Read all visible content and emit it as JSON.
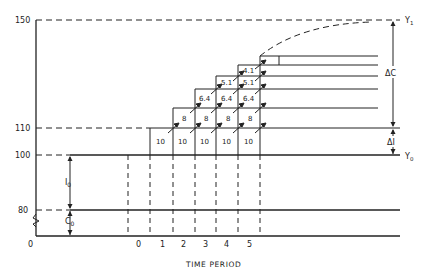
{
  "diagram": {
    "y_axis": {
      "ticks": [
        {
          "label": "150",
          "y": 20
        },
        {
          "label": "110",
          "y": 128
        },
        {
          "label": "100",
          "y": 155
        },
        {
          "label": "80",
          "y": 210
        },
        {
          "label": "0",
          "y": 236
        }
      ]
    },
    "x_axis": {
      "title": "TIME PERIOD",
      "periods": [
        "0",
        "1",
        "2",
        "3",
        "4",
        "5"
      ]
    },
    "left_annotations": {
      "investment": "I",
      "investment_sub": "0",
      "consumption": "C",
      "consumption_sub": "0"
    },
    "right_annotations": {
      "y1": "Y",
      "y1_sub": "1",
      "y0": "Y",
      "y0_sub": "0",
      "delta_c": "ΔC",
      "delta_i": "ΔI"
    },
    "staircase": {
      "row1": [
        "10",
        "10",
        "10",
        "10",
        "10"
      ],
      "row2": [
        "8",
        "8",
        "8",
        "8"
      ],
      "row3": [
        "6.4",
        "6.4",
        "6.4"
      ],
      "row4": [
        "5.1",
        "5.1"
      ],
      "row5": [
        "4.1"
      ]
    }
  }
}
